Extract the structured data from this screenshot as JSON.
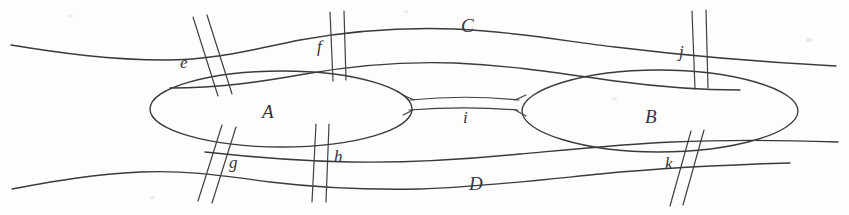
{
  "figure": {
    "ink_color": "#3a3a40",
    "background_color": "#fdfdfc",
    "regions": [
      {
        "id": "A",
        "label": "A",
        "shape": "ellipse",
        "x": 268,
        "y": 112
      },
      {
        "id": "B",
        "label": "B",
        "shape": "ellipse",
        "x": 652,
        "y": 117
      },
      {
        "id": "C",
        "label": "C",
        "shape": "bank-top",
        "x": 467,
        "y": 26
      },
      {
        "id": "D",
        "label": "D",
        "shape": "bank-bottom",
        "x": 474,
        "y": 184
      }
    ],
    "bridges": [
      {
        "id": "e",
        "label": "e",
        "connects": "C-A",
        "x": 183,
        "y": 62
      },
      {
        "id": "f",
        "label": "f",
        "connects": "C-A",
        "x": 319,
        "y": 47
      },
      {
        "id": "g",
        "label": "g",
        "connects": "A-D",
        "x": 232,
        "y": 163
      },
      {
        "id": "h",
        "label": "h",
        "connects": "A-D",
        "x": 337,
        "y": 157
      },
      {
        "id": "i",
        "label": "i",
        "connects": "A-B",
        "x": 466,
        "y": 117
      },
      {
        "id": "j",
        "label": "j",
        "connects": "C-B",
        "x": 682,
        "y": 52
      },
      {
        "id": "k",
        "label": "k",
        "connects": "B-D",
        "x": 668,
        "y": 164
      }
    ]
  }
}
